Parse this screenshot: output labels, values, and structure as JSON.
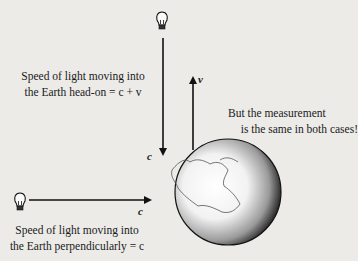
{
  "diagram": {
    "top_caption": [
      "Speed of light moving into",
      "the Earth head-on = c + v"
    ],
    "right_caption": [
      "But the measurement",
      "is the same in both cases!"
    ],
    "bottom_caption": [
      "Speed of light moving into",
      "the Earth perpendicularly = c"
    ],
    "labels": {
      "vertical_arrow_c": "c",
      "horizontal_arrow_c": "c",
      "earth_velocity_v": "v"
    },
    "icons": [
      "lightbulb-icon-top",
      "lightbulb-icon-left",
      "earth-globe"
    ]
  }
}
